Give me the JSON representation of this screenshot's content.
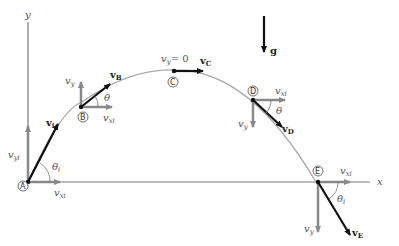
{
  "figure": {
    "axes": {
      "x_label": "x",
      "y_label": "y"
    },
    "gravity": {
      "label": "g",
      "vector": true
    },
    "points": [
      {
        "id": "A",
        "label": "A",
        "velocity_label": "v",
        "velocity_sub": "i",
        "vx_label": "v",
        "vx_sub": "xi",
        "vy_label": "v",
        "vy_sub": "yi",
        "angle_label": "θ",
        "angle_sub": "i"
      },
      {
        "id": "B",
        "label": "B",
        "velocity_label": "v",
        "velocity_sub": "B",
        "vx_label": "v",
        "vx_sub": "xi",
        "vy_label": "v",
        "vy_sub": "y",
        "angle_label": "θ"
      },
      {
        "id": "C",
        "label": "C",
        "velocity_label": "v",
        "velocity_sub": "C",
        "vy_text": "v",
        "vy_sub": "y",
        "vy_eq": "= 0"
      },
      {
        "id": "D",
        "label": "D",
        "velocity_label": "v",
        "velocity_sub": "D",
        "vx_label": "v",
        "vx_sub": "xi",
        "vy_label": "v",
        "vy_sub": "y",
        "angle_label": "θ"
      },
      {
        "id": "E",
        "label": "E",
        "velocity_label": "v",
        "velocity_sub": "E",
        "vx_label": "v",
        "vx_sub": "xi",
        "vy_label": "v",
        "vy_sub": "y",
        "angle_label": "θ",
        "angle_sub": "i"
      }
    ]
  }
}
